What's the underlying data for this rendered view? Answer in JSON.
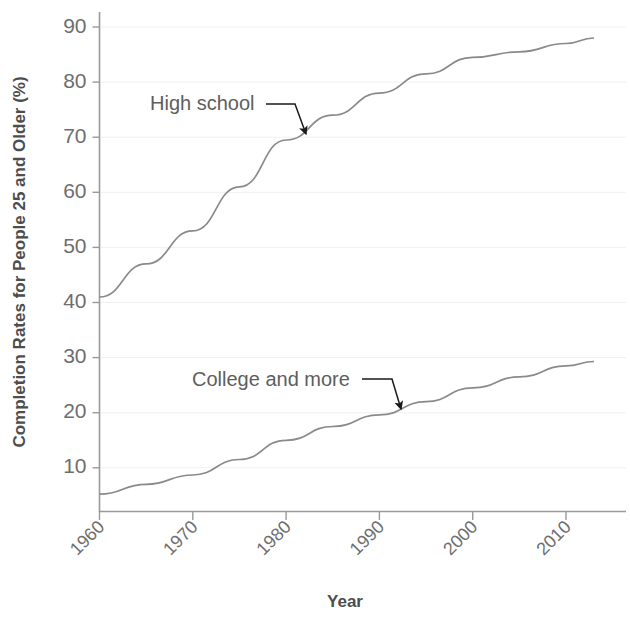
{
  "chart_data": {
    "type": "line",
    "title": "",
    "xlabel": "Year",
    "ylabel": "Completion Rates for People 25 and Older (%)",
    "xlim": [
      1960,
      2013
    ],
    "ylim": [
      4,
      92
    ],
    "grid": true,
    "legend_position": "inline-annotations",
    "xticks": [
      "1960",
      "1970",
      "1980",
      "1990",
      "2000",
      "2010"
    ],
    "xtick_values": [
      1960,
      1970,
      1980,
      1990,
      2000,
      2010
    ],
    "yticks": [
      "10",
      "20",
      "30",
      "40",
      "50",
      "60",
      "70",
      "80",
      "90"
    ],
    "ytick_values": [
      10,
      20,
      30,
      40,
      50,
      60,
      70,
      80,
      90
    ],
    "x": [
      1960,
      1965,
      1970,
      1975,
      1980,
      1985,
      1990,
      1995,
      2000,
      2005,
      2010,
      2013
    ],
    "series": [
      {
        "name": "High school",
        "color": "#8a8a8a",
        "values": [
          41,
          47,
          53,
          61,
          69.5,
          74,
          78,
          81.5,
          84.5,
          85.5,
          87,
          88
        ]
      },
      {
        "name": "College and more",
        "color": "#8a8a8a",
        "values": [
          5.2,
          7,
          8.7,
          11.5,
          15,
          17.5,
          19.6,
          22,
          24.5,
          26.5,
          28.5,
          29.3
        ]
      }
    ],
    "annotations": [
      {
        "text": "High school",
        "label_x": 150,
        "label_y": 110,
        "arrow_from_x": 266,
        "arrow_from_y": 104,
        "arrow_mid_x": 295,
        "arrow_mid_y": 104,
        "arrow_to_x": 306,
        "arrow_to_y": 134
      },
      {
        "text": "College and more",
        "label_x": 192,
        "label_y": 386,
        "arrow_from_x": 362,
        "arrow_from_y": 379,
        "arrow_mid_x": 392,
        "arrow_mid_y": 379,
        "arrow_to_x": 401,
        "arrow_to_y": 409
      }
    ]
  },
  "axes": {
    "y_axis_title": "Completion Rates for People 25 and Older (%)",
    "x_axis_title": "Year",
    "axis_color": "#9a9a9a",
    "grid_color": "#f0f0f2",
    "tick_text_color": "#6e6e6e"
  }
}
